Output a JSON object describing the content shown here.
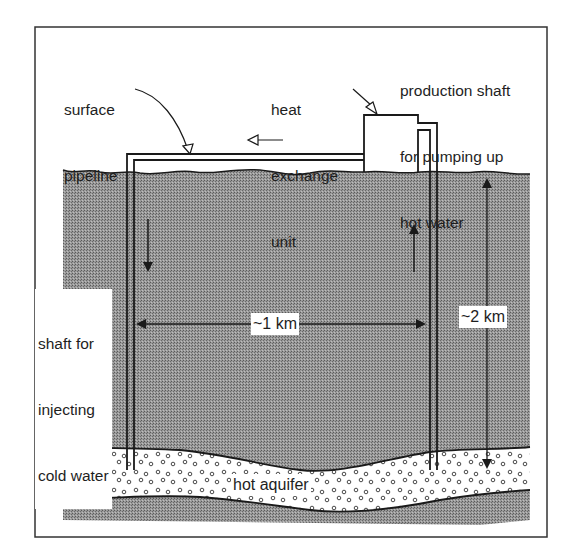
{
  "diagram": {
    "labels": {
      "surface_pipeline": [
        "surface",
        "pipeline"
      ],
      "heat_exchange_unit": [
        "heat",
        "exchange",
        "unit"
      ],
      "production_shaft": [
        "production shaft",
        "for pumping up",
        "hot water"
      ],
      "injection_shaft": [
        "shaft for",
        "injecting",
        "cold water"
      ],
      "horizontal_distance": "~1 km",
      "depth": "~2 km",
      "aquifer": "hot aquifer"
    },
    "flow_arrows": {
      "pipeline_flow": "left",
      "injection_flow": "down",
      "production_flow": "up"
    },
    "colors": {
      "ground": "#8f8f8f",
      "aquifer": "#ffffff",
      "line": "#1a1a1a",
      "frame": "#333333"
    }
  }
}
